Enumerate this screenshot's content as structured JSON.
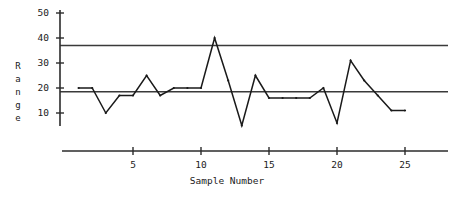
{
  "chart_data": {
    "type": "line",
    "title": "",
    "subtitle": "",
    "xlabel": "Sample Number",
    "ylabel": "Range",
    "ylabel_letters": [
      "R",
      "a",
      "n",
      "g",
      "e"
    ],
    "x": [
      1,
      2,
      3,
      4,
      5,
      6,
      7,
      8,
      9,
      10,
      11,
      12,
      13,
      14,
      15,
      16,
      17,
      18,
      19,
      20,
      21,
      22,
      23,
      24,
      25
    ],
    "values": [
      20,
      20,
      10,
      17,
      17,
      25,
      17,
      20,
      20,
      20,
      40,
      23,
      5,
      25,
      16,
      16,
      16,
      16,
      20,
      6,
      31,
      23,
      17,
      11,
      11
    ],
    "series": [
      {
        "name": "Range",
        "values": [
          20,
          20,
          10,
          17,
          17,
          25,
          17,
          20,
          20,
          20,
          40,
          23,
          5,
          25,
          16,
          16,
          16,
          16,
          20,
          6,
          31,
          23,
          17,
          11,
          11
        ]
      }
    ],
    "xlim": [
      0,
      27
    ],
    "ylim": [
      0,
      52
    ],
    "yticks": [
      10,
      20,
      30,
      40,
      50
    ],
    "ytick_labels": [
      "10",
      "20",
      "30",
      "40",
      "50"
    ],
    "xticks": [
      5,
      10,
      15,
      20,
      25
    ],
    "xtick_labels": [
      "5",
      "10",
      "15",
      "20",
      "25"
    ],
    "grid": false,
    "legend": "none",
    "reference_lines": [
      {
        "name": "upper-control-limit",
        "value": 37
      },
      {
        "name": "center-line",
        "value": 18.5
      }
    ],
    "line_color": "#1a1a1a",
    "limit_line_color": "#3a3a3a",
    "axis_color": "#2b2b2b",
    "background": "#ffffff"
  }
}
